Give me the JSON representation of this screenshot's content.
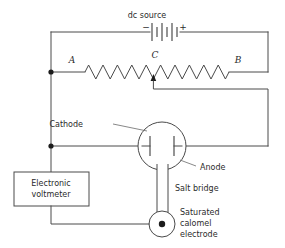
{
  "diagram": {
    "source": {
      "label": "dc source",
      "negative_terminal": "−",
      "positive_terminal": "+",
      "icon": "battery-icon",
      "cell_count": 3
    },
    "resistor": {
      "icon": "resistor-zigzag-icon",
      "terminal_a": "A",
      "terminal_b": "B",
      "tap_point": "C",
      "tap_icon": "slider-tap-arrow-icon"
    },
    "cell": {
      "icon": "electrochemical-cell-icon",
      "cathode_label": "Cathode",
      "anode_label": "Anode"
    },
    "salt_bridge": {
      "label": "Salt bridge",
      "icon": "salt-bridge-tube-icon"
    },
    "reference_electrode": {
      "icon": "calomel-electrode-icon",
      "label_line_1": "Saturated",
      "label_line_2": "calomel",
      "label_line_3": "electrode"
    },
    "voltmeter": {
      "icon": "voltmeter-box-icon",
      "label_line_1": "Electronic",
      "label_line_2": "voltmeter"
    },
    "colors": {
      "wire": "#4a4a4a",
      "text": "#2b2b2b",
      "node": "#1c1c1c",
      "background": "#ffffff"
    }
  }
}
